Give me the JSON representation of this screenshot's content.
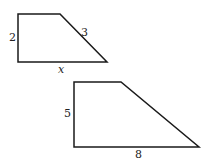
{
  "figures": [
    {
      "name": "small-trapezoid",
      "labels": {
        "left_side": "2",
        "slanted_side": "3",
        "bottom_side": "x"
      }
    },
    {
      "name": "large-trapezoid",
      "labels": {
        "left_side": "5",
        "bottom_side": "8"
      }
    }
  ],
  "colors": {
    "stroke": "#1a1a1a",
    "background": "#ffffff"
  }
}
